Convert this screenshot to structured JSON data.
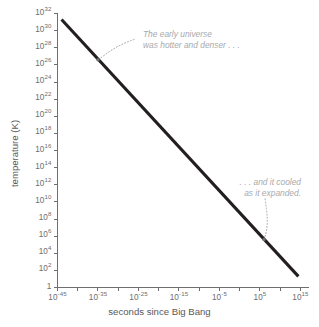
{
  "chart_data": {
    "type": "line",
    "title": "",
    "subtitle": "",
    "xlabel": "seconds since Big Bang",
    "ylabel": "temperature (K)",
    "xscale": "log10",
    "yscale": "log10",
    "xlim_exp": [
      -45,
      17
    ],
    "ylim_exp": [
      0,
      32
    ],
    "grid": false,
    "legend": null,
    "x_tick_labels": [
      {
        "mantissa": "10",
        "exponent": "-45",
        "value_exp": -45
      },
      {
        "mantissa": "10",
        "exponent": "-35",
        "value_exp": -35
      },
      {
        "mantissa": "10",
        "exponent": "-25",
        "value_exp": -25
      },
      {
        "mantissa": "10",
        "exponent": "-15",
        "value_exp": -15
      },
      {
        "mantissa": "10",
        "exponent": "-5",
        "value_exp": -5
      },
      {
        "mantissa": "10",
        "exponent": "5",
        "value_exp": 5
      },
      {
        "mantissa": "10",
        "exponent": "15",
        "value_exp": 15
      }
    ],
    "x_minor_tick_exps": [
      -40,
      -30,
      -20,
      -10,
      0,
      10
    ],
    "y_tick_labels": [
      {
        "mantissa": "10",
        "exponent": "32",
        "value_exp": 32
      },
      {
        "mantissa": "10",
        "exponent": "30",
        "value_exp": 30
      },
      {
        "mantissa": "10",
        "exponent": "28",
        "value_exp": 28
      },
      {
        "mantissa": "10",
        "exponent": "26",
        "value_exp": 26
      },
      {
        "mantissa": "10",
        "exponent": "24",
        "value_exp": 24
      },
      {
        "mantissa": "10",
        "exponent": "22",
        "value_exp": 22
      },
      {
        "mantissa": "10",
        "exponent": "20",
        "value_exp": 20
      },
      {
        "mantissa": "10",
        "exponent": "18",
        "value_exp": 18
      },
      {
        "mantissa": "10",
        "exponent": "16",
        "value_exp": 16
      },
      {
        "mantissa": "10",
        "exponent": "14",
        "value_exp": 14
      },
      {
        "mantissa": "10",
        "exponent": "12",
        "value_exp": 12
      },
      {
        "mantissa": "10",
        "exponent": "10",
        "value_exp": 10
      },
      {
        "mantissa": "10",
        "exponent": "8",
        "value_exp": 8
      },
      {
        "mantissa": "10",
        "exponent": "6",
        "value_exp": 6
      },
      {
        "mantissa": "10",
        "exponent": "4",
        "value_exp": 4
      },
      {
        "mantissa": "10",
        "exponent": "2",
        "value_exp": 2
      },
      {
        "mantissa": "1",
        "exponent": "",
        "value_exp": 0
      }
    ],
    "series": [
      {
        "name": "temperature of the universe",
        "color": "#231f20",
        "points_exp": [
          {
            "x_exp": -44.0,
            "y_exp": 31.3
          },
          {
            "x_exp": 14.5,
            "y_exp": 1.3
          }
        ]
      }
    ],
    "annotations": [
      {
        "id": "early",
        "lines": [
          "The early universe",
          "was hotter and denser . . ."
        ],
        "target_exp": {
          "x_exp": -35.0,
          "y_exp": 26.6
        },
        "color": "#a7a9ac"
      },
      {
        "id": "cooled",
        "lines": [
          ". . . and it cooled",
          "as it expanded."
        ],
        "target_exp": {
          "x_exp": 6.0,
          "y_exp": 5.6
        },
        "color": "#a7a9ac"
      }
    ]
  },
  "axes": {
    "x_title": "seconds since Big Bang",
    "y_title": "temperature (K)"
  },
  "annotation_text": {
    "early_line1": "The early universe",
    "early_line2": "was hotter and denser . . .",
    "cooled_line1": ". . . and it cooled",
    "cooled_line2": "as it expanded."
  },
  "colors": {
    "line": "#231f20",
    "axis": "#6d6e71",
    "annotation": "#a7a9ac",
    "background": "#ffffff"
  }
}
